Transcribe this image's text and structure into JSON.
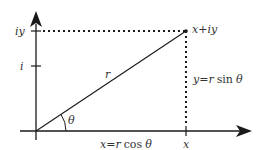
{
  "diagram": {
    "type": "complex-plane-polar-form",
    "colors": {
      "stroke": "#1a1a1a",
      "text": "#333333",
      "background": "#ffffff"
    },
    "labels": {
      "point": "x+iy",
      "y_axis_top": "iy",
      "y_axis_unit": "i",
      "radius": "r",
      "angle": "θ",
      "x_tick": "x",
      "vertical_leg_lhs": "y",
      "vertical_leg_eq": "=",
      "vertical_leg_r": "r",
      "vertical_leg_fn": "sin",
      "vertical_leg_theta": "θ",
      "horizontal_leg_lhs": "x",
      "horizontal_leg_eq": "=",
      "horizontal_leg_r": "r",
      "horizontal_leg_fn": "cos",
      "horizontal_leg_theta": "θ"
    }
  }
}
